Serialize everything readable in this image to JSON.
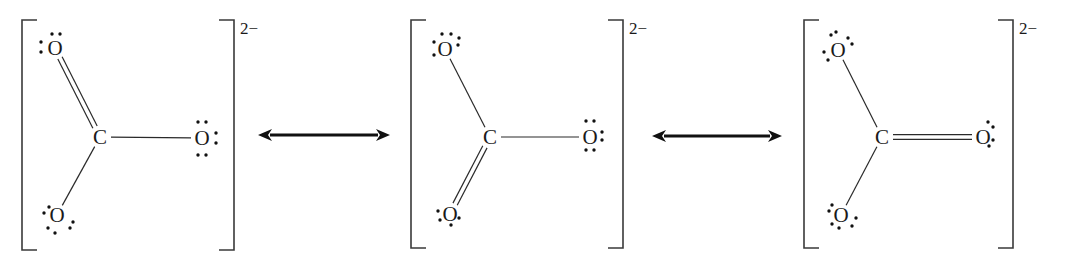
{
  "colors": {
    "ink": "#1a1a1a",
    "background": "#ffffff"
  },
  "structures": [
    {
      "id": "structure-1",
      "charge": "2−",
      "bracket": {
        "left": 22,
        "right": 234,
        "top": 20,
        "bottom": 250
      },
      "charge_pos": {
        "x": 240,
        "y": 34
      },
      "atoms": [
        {
          "id": "C",
          "label": "C",
          "x": 100,
          "y": 137
        },
        {
          "id": "O1",
          "label": "O",
          "x": 55,
          "y": 48,
          "lone_pairs": [
            [
              41,
              42
            ],
            [
              41,
              52
            ],
            [
              52,
              34
            ],
            [
              60,
              34
            ]
          ]
        },
        {
          "id": "O2",
          "label": "O",
          "x": 202,
          "y": 138,
          "lone_pairs": [
            [
              198,
              122
            ],
            [
              206,
              122
            ],
            [
              198,
              155
            ],
            [
              206,
              155
            ],
            [
              216,
              133
            ],
            [
              216,
              143
            ]
          ]
        },
        {
          "id": "O3",
          "label": "O",
          "x": 57,
          "y": 215,
          "lone_pairs": [
            [
              44,
              213
            ],
            [
              49,
              207
            ],
            [
              48,
              228
            ],
            [
              55,
              233
            ],
            [
              70,
              228
            ],
            [
              73,
              222
            ]
          ]
        }
      ],
      "bonds": [
        {
          "from": "C",
          "to": "O1",
          "order": 2
        },
        {
          "from": "C",
          "to": "O2",
          "order": 1
        },
        {
          "from": "C",
          "to": "O3",
          "order": 1
        }
      ]
    },
    {
      "id": "structure-2",
      "charge": "2−",
      "bracket": {
        "left": 411,
        "right": 623,
        "top": 20,
        "bottom": 248
      },
      "charge_pos": {
        "x": 629,
        "y": 34
      },
      "atoms": [
        {
          "id": "C",
          "label": "C",
          "x": 490,
          "y": 137
        },
        {
          "id": "O1",
          "label": "O",
          "x": 445,
          "y": 49,
          "lone_pairs": [
            [
              434,
              42
            ],
            [
              434,
              55
            ],
            [
              442,
              34
            ],
            [
              451,
              34
            ],
            [
              459,
              38
            ],
            [
              458,
              45
            ]
          ]
        },
        {
          "id": "O2",
          "label": "O",
          "x": 590,
          "y": 137,
          "lone_pairs": [
            [
              586,
              121
            ],
            [
              594,
              121
            ],
            [
              586,
              150
            ],
            [
              594,
              150
            ],
            [
              602,
              132
            ],
            [
              602,
              140
            ]
          ]
        },
        {
          "id": "O3",
          "label": "O",
          "x": 450,
          "y": 214,
          "lone_pairs": [
            [
              438,
              211
            ],
            [
              440,
              220
            ],
            [
              451,
              225
            ],
            [
              459,
              218
            ]
          ]
        }
      ],
      "bonds": [
        {
          "from": "C",
          "to": "O1",
          "order": 1
        },
        {
          "from": "C",
          "to": "O2",
          "order": 1
        },
        {
          "from": "C",
          "to": "O3",
          "order": 2
        }
      ]
    },
    {
      "id": "structure-3",
      "charge": "2−",
      "bracket": {
        "left": 804,
        "right": 1013,
        "top": 20,
        "bottom": 248
      },
      "charge_pos": {
        "x": 1019,
        "y": 34
      },
      "atoms": [
        {
          "id": "C",
          "label": "C",
          "x": 882,
          "y": 137
        },
        {
          "id": "O1",
          "label": "O",
          "x": 838,
          "y": 50,
          "lone_pairs": [
            [
              824,
              52
            ],
            [
              828,
              60
            ],
            [
              831,
              35
            ],
            [
              836,
              32
            ],
            [
              848,
              38
            ],
            [
              852,
              44
            ]
          ]
        },
        {
          "id": "O2",
          "label": "O",
          "x": 983,
          "y": 137,
          "lone_pairs": [
            [
              988,
              122
            ],
            [
              993,
              127
            ],
            [
              993,
              140
            ],
            [
              989,
              146
            ]
          ]
        },
        {
          "id": "O3",
          "label": "O",
          "x": 841,
          "y": 215,
          "lone_pairs": [
            [
              829,
              211
            ],
            [
              832,
              205
            ],
            [
              832,
              224
            ],
            [
              839,
              228
            ],
            [
              852,
              226
            ],
            [
              856,
              218
            ]
          ]
        }
      ],
      "bonds": [
        {
          "from": "C",
          "to": "O1",
          "order": 1
        },
        {
          "from": "C",
          "to": "O2",
          "order": 2
        },
        {
          "from": "C",
          "to": "O3",
          "order": 1
        }
      ]
    }
  ],
  "arrows": [
    {
      "id": "resonance-arrow-1",
      "x1": 258,
      "x2": 390,
      "y": 135
    },
    {
      "id": "resonance-arrow-2",
      "x1": 652,
      "x2": 782,
      "y": 136
    }
  ]
}
